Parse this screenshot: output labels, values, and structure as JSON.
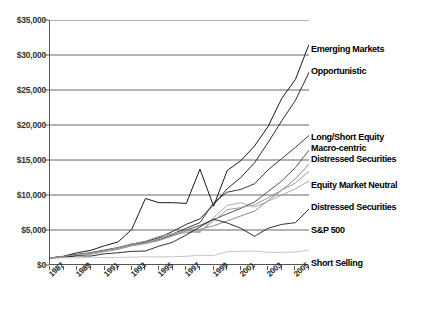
{
  "chart_data": {
    "type": "line",
    "title": "",
    "xlabel": "",
    "ylabel": "",
    "ylim": [
      0,
      35000
    ],
    "xlim": [
      1987,
      2006
    ],
    "grid": true,
    "legend_position": "right-inline-labels",
    "ytick_labels": [
      "$35,000",
      "$30,000",
      "$25,000",
      "$20,000",
      "$15,000",
      "$10,000",
      "$5,000",
      "$0"
    ],
    "ytick_values": [
      35000,
      30000,
      25000,
      20000,
      15000,
      10000,
      5000,
      0
    ],
    "xtick_labels": [
      "1987",
      "1989",
      "1991",
      "1993",
      "1995",
      "1997",
      "1999",
      "2001",
      "2003",
      "2005"
    ],
    "xtick_values": [
      1987,
      1989,
      1991,
      1993,
      1995,
      1997,
      1999,
      2001,
      2003,
      2005
    ],
    "x": [
      1987,
      1988,
      1989,
      1990,
      1991,
      1992,
      1993,
      1994,
      1995,
      1996,
      1997,
      1998,
      1999,
      2000,
      2001,
      2002,
      2003,
      2004,
      2005,
      2006
    ],
    "series": [
      {
        "name": "Emerging Markets",
        "color": "#1a1a1a",
        "width": 1.0,
        "values": [
          1000,
          1250,
          1750,
          2100,
          2750,
          3300,
          5100,
          9500,
          8900,
          8900,
          8800,
          13700,
          8400,
          13500,
          14900,
          17000,
          19800,
          23800,
          26500,
          31500
        ]
      },
      {
        "name": "Opportunistic",
        "color": "#2b2b2b",
        "width": 1.0,
        "values": [
          1000,
          1200,
          1480,
          1680,
          2050,
          2400,
          2950,
          3350,
          3900,
          4800,
          5800,
          6600,
          8600,
          10900,
          12500,
          14600,
          17500,
          20600,
          23500,
          27500
        ]
      },
      {
        "name": "Long/Short Equity",
        "color": "#3a3a3a",
        "width": 1.0,
        "values": [
          1000,
          1180,
          1420,
          1620,
          1980,
          2320,
          2820,
          3150,
          3700,
          4450,
          5250,
          6050,
          8900,
          10400,
          10800,
          11600,
          13600,
          15200,
          16800,
          18500
        ]
      },
      {
        "name": "Macro-centric",
        "color": "#555555",
        "width": 1.0,
        "values": [
          1000,
          1220,
          1520,
          1780,
          2150,
          2500,
          3000,
          3250,
          3650,
          4300,
          5000,
          5650,
          6500,
          7300,
          8100,
          9000,
          10500,
          12000,
          13900,
          16400
        ]
      },
      {
        "name": "Distressed Securities",
        "color": "#8a8a8a",
        "width": 1.0,
        "values": [
          1000,
          1150,
          1380,
          1550,
          1900,
          2250,
          2750,
          3050,
          3500,
          4150,
          4850,
          5100,
          5600,
          6300,
          7000,
          7700,
          9200,
          10700,
          12300,
          14400
        ]
      },
      {
        "name": "Equity Market Neutral",
        "color": "#9a9a9a",
        "width": 1.0,
        "values": [
          1000,
          1200,
          1450,
          1700,
          2050,
          2450,
          3000,
          3400,
          4100,
          4500,
          4600,
          4800,
          6300,
          7900,
          8200,
          8600,
          9600,
          10700,
          11700,
          13400
        ]
      },
      {
        "name": "Distressed Securities",
        "color": "#aaaaaa",
        "width": 1.0,
        "values": [
          1000,
          1160,
          1400,
          1600,
          1950,
          2300,
          2800,
          3150,
          3750,
          4450,
          4900,
          4600,
          6800,
          8500,
          8900,
          8300,
          9100,
          10000,
          10900,
          12000
        ]
      },
      {
        "name": "S&P 500",
        "color": "#1a1a1a",
        "width": 0.9,
        "values": [
          1000,
          1100,
          1300,
          1280,
          1600,
          1750,
          1950,
          2000,
          2700,
          3250,
          4300,
          5450,
          6550,
          6000,
          5250,
          4100,
          5250,
          5800,
          6050,
          8000
        ]
      },
      {
        "name": "Short Selling",
        "color": "#c8c8c8",
        "width": 1.0,
        "values": [
          1000,
          1030,
          1010,
          1100,
          1060,
          1080,
          1120,
          1180,
          1150,
          1180,
          1250,
          1400,
          1350,
          1900,
          1950,
          2000,
          1800,
          1800,
          1850,
          2100
        ]
      }
    ]
  },
  "series_labels": [
    {
      "text": "Emerging Markets",
      "top": 44
    },
    {
      "text": "Opportunistic",
      "top": 66
    },
    {
      "text": "Long/Short Equity",
      "top": 132
    },
    {
      "text": "Macro-centric",
      "top": 143
    },
    {
      "text": "Distressed Securities",
      "top": 154
    },
    {
      "text": "Equity Market Neutral",
      "top": 180
    },
    {
      "text": "Distressed Securities",
      "top": 202
    },
    {
      "text": "S&P 500",
      "top": 225
    },
    {
      "text": "Short Selling",
      "top": 258
    }
  ],
  "caption": ""
}
